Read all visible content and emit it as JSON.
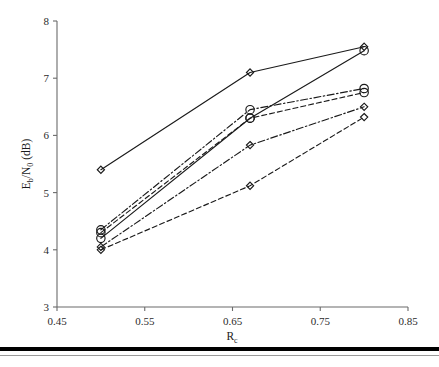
{
  "chart_data": {
    "type": "line",
    "title": "",
    "xlabel": "Rc",
    "ylabel": "Eb/N0 (dB)",
    "xlabel_base": "R",
    "xlabel_sub": "c",
    "ylabel_parts": {
      "e": "E",
      "b": "b",
      "slash": "/N",
      "zero": "0",
      "unit": " (dB)"
    },
    "xlim": [
      0.45,
      0.85
    ],
    "ylim": [
      3,
      8
    ],
    "xticks": [
      0.45,
      0.55,
      0.65,
      0.75,
      0.85
    ],
    "xtick_labels": [
      "0.45",
      "0.55",
      "0.65",
      "0.75",
      "0.85"
    ],
    "yticks": [
      3,
      4,
      5,
      6,
      7,
      8
    ],
    "ytick_labels": [
      "3",
      "4",
      "5",
      "6",
      "7",
      "8"
    ],
    "grid": false,
    "legend": "none",
    "x": [
      0.5,
      0.67,
      0.8
    ],
    "series": [
      {
        "name": "series-1-solid-diamond",
        "dash": "solid",
        "marker": "diamond",
        "values": [
          5.4,
          7.1,
          7.55
        ]
      },
      {
        "name": "series-2-dashdot-circle",
        "dash": "dashdot",
        "marker": "circle",
        "values": [
          4.35,
          6.45,
          6.82
        ]
      },
      {
        "name": "series-3-solid-circle",
        "dash": "solid",
        "marker": "circle",
        "values": [
          4.2,
          6.3,
          7.48
        ]
      },
      {
        "name": "series-4-dashed-circle",
        "dash": "dashed",
        "marker": "circle",
        "values": [
          4.3,
          6.3,
          6.75
        ]
      },
      {
        "name": "series-5-dashdot-diamond",
        "dash": "dashdot",
        "marker": "diamond",
        "values": [
          4.05,
          5.83,
          6.5
        ]
      },
      {
        "name": "series-6-dashed-diamond",
        "dash": "dashed",
        "marker": "diamond",
        "values": [
          4.0,
          5.12,
          6.32
        ]
      }
    ],
    "colors": {
      "line": "#1a1a1a",
      "axis": "#6b6b6b",
      "text": "#2b2b2b",
      "background": "#ffffff"
    }
  }
}
